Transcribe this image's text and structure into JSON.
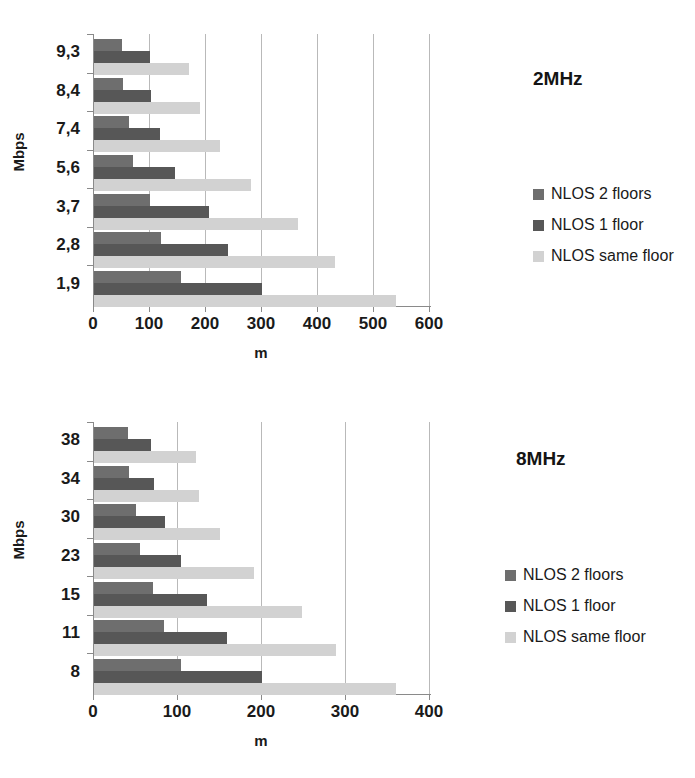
{
  "chart_data": [
    {
      "type": "bar",
      "orientation": "horizontal",
      "title": "2MHz",
      "xlabel": "m",
      "ylabel": "Mbps",
      "categories": [
        "9,3",
        "8,4",
        "7,4",
        "5,6",
        "3,7",
        "2,8",
        "1,9"
      ],
      "xlim": [
        0,
        600
      ],
      "xticks": [
        0,
        100,
        200,
        300,
        400,
        500,
        600
      ],
      "grid": true,
      "legend_position": "right",
      "series": [
        {
          "name": "NLOS 2 floors",
          "color": "#6e6e6e",
          "values": [
            50,
            52,
            62,
            70,
            100,
            120,
            155
          ]
        },
        {
          "name": "NLOS 1 floor",
          "color": "#575757",
          "values": [
            100,
            102,
            118,
            145,
            205,
            240,
            300
          ]
        },
        {
          "name": "NLOS same floor",
          "color": "#d2d2d2",
          "values": [
            170,
            190,
            225,
            280,
            365,
            430,
            540
          ]
        }
      ]
    },
    {
      "type": "bar",
      "orientation": "horizontal",
      "title": "8MHz",
      "xlabel": "m",
      "ylabel": "Mbps",
      "categories": [
        "38",
        "34",
        "30",
        "23",
        "15",
        "11",
        "8"
      ],
      "xlim": [
        0,
        400
      ],
      "xticks": [
        0,
        100,
        200,
        300,
        400
      ],
      "grid": true,
      "legend_position": "right",
      "series": [
        {
          "name": "NLOS 2 floors",
          "color": "#6e6e6e",
          "values": [
            40,
            42,
            50,
            55,
            70,
            83,
            103
          ]
        },
        {
          "name": "NLOS 1 floor",
          "color": "#575757",
          "values": [
            68,
            72,
            85,
            103,
            135,
            158,
            200
          ]
        },
        {
          "name": "NLOS same floor",
          "color": "#d2d2d2",
          "values": [
            122,
            125,
            150,
            190,
            248,
            288,
            360
          ]
        }
      ]
    }
  ]
}
